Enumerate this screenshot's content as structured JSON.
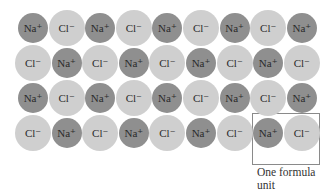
{
  "diagram": {
    "type": "ionic-lattice",
    "rows": [
      [
        "Na⁺",
        "Cl⁻",
        "Na⁺",
        "Cl⁻",
        "Na⁺",
        "Cl⁻",
        "Na⁺",
        "Cl⁻",
        "Na⁺"
      ],
      [
        "Cl⁻",
        "Na⁺",
        "Cl⁻",
        "Na⁺",
        "Cl⁻",
        "Na⁺",
        "Cl⁻",
        "Na⁺",
        "Cl⁻"
      ],
      [
        "Na⁺",
        "Cl⁻",
        "Na⁺",
        "Cl⁻",
        "Na⁺",
        "Cl⁻",
        "Na⁺",
        "Cl⁻",
        "Na⁺"
      ],
      [
        "Cl⁻",
        "Na⁺",
        "Cl⁻",
        "Na⁺",
        "Cl⁻",
        "Na⁺",
        "Cl⁻",
        "Na⁺",
        "Cl⁻"
      ]
    ],
    "highlight": {
      "row": 3,
      "cols": [
        7,
        8
      ]
    },
    "caption_line1": "One formula",
    "caption_line2": "unit",
    "colors": {
      "sodium": "#8f8f8f",
      "chloride": "#cfcfcf"
    }
  }
}
